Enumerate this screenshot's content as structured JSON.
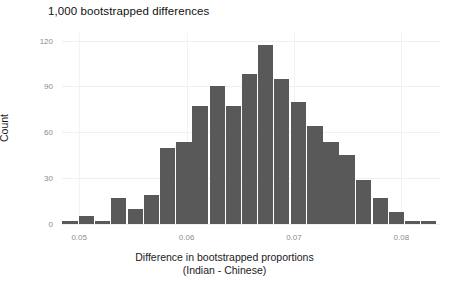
{
  "chart_data": {
    "type": "bar",
    "title": "1,000 bootstrapped differences",
    "xlabel": "Difference in bootstrapped proportions",
    "xlabel_line2": "(Indian - Chinese)",
    "ylabel": "Count",
    "xlim": [
      0.0484,
      0.0836
    ],
    "ylim": [
      0,
      125
    ],
    "grid": true,
    "legend": null,
    "bar_color": "#595959",
    "bin_width": 0.00152,
    "x_ticks": [
      0.05,
      0.06,
      0.07,
      0.08
    ],
    "x_tick_labels": [
      "0.05",
      "0.06",
      "0.07",
      "0.08"
    ],
    "y_ticks": [
      0,
      30,
      60,
      90,
      120
    ],
    "y_tick_labels": [
      "0",
      "30",
      "60",
      "90",
      "120"
    ],
    "bin_centers": [
      0.0492,
      0.0507,
      0.0522,
      0.0537,
      0.0553,
      0.0568,
      0.0583,
      0.0598,
      0.0613,
      0.0629,
      0.0644,
      0.0659,
      0.0674,
      0.0689,
      0.0705,
      0.072,
      0.0735,
      0.075,
      0.0765,
      0.0781,
      0.0796,
      0.0811,
      0.0826
    ],
    "values": [
      2,
      5,
      2,
      17,
      10,
      19,
      50,
      54,
      77,
      90,
      77,
      98,
      117,
      95,
      80,
      64,
      54,
      45,
      29,
      17,
      8,
      2,
      2
    ],
    "n_bins": 23,
    "total_count": 1000
  }
}
